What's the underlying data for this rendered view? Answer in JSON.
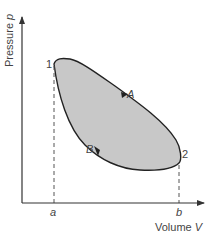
{
  "diagram": {
    "type": "pv-cycle",
    "y_axis": {
      "label": "Pressure",
      "symbol": "p"
    },
    "x_axis": {
      "label": "Volume",
      "symbol": "V"
    },
    "points": [
      {
        "id": "1",
        "label": "1"
      },
      {
        "id": "2",
        "label": "2"
      }
    ],
    "paths": [
      {
        "id": "A",
        "label": "A",
        "from": "1",
        "to": "2",
        "direction": "down-right"
      },
      {
        "id": "B",
        "label": "B",
        "from": "2",
        "to": "1",
        "direction": "up-left"
      }
    ],
    "x_ticks": [
      {
        "label": "a"
      },
      {
        "label": "b"
      }
    ],
    "colors": {
      "fill": "#c8c8c8",
      "stroke": "#222222",
      "axis": "#333333",
      "text": "#444444"
    }
  }
}
